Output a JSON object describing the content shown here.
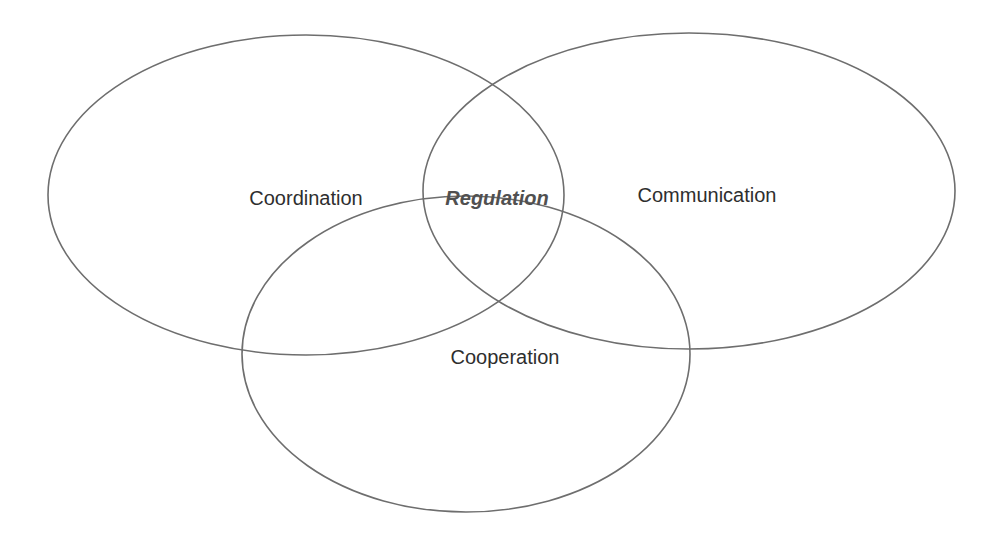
{
  "diagram": {
    "type": "venn",
    "stroke_color": "#6e6e6e",
    "text_color": "#2e2e2e",
    "sets": [
      {
        "id": "coordination",
        "label": "Coordination",
        "cx": 306,
        "cy": 195,
        "rx": 258,
        "ry": 160
      },
      {
        "id": "communication",
        "label": "Communication",
        "cx": 689,
        "cy": 191,
        "rx": 266,
        "ry": 158
      },
      {
        "id": "cooperation",
        "label": "Cooperation",
        "cx": 467,
        "cy": 354,
        "rx": 224,
        "ry": 158
      }
    ],
    "center_label": "Regulation",
    "label_positions": {
      "coordination": {
        "x": 306,
        "y": 198
      },
      "communication": {
        "x": 707,
        "y": 195
      },
      "cooperation": {
        "x": 505,
        "y": 357
      },
      "regulation": {
        "x": 497,
        "y": 198
      }
    }
  }
}
